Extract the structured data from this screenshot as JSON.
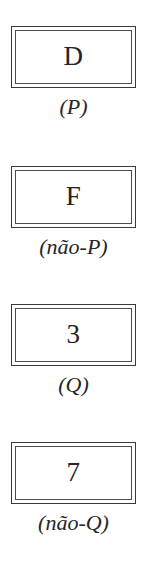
{
  "diagram": {
    "kind": "wason-selection-task-cards",
    "background_color": "#ffffff",
    "ink_color": "#2b2b2b",
    "border_color": "#3a3a3a",
    "cards": [
      {
        "face": "D",
        "label": "(P)"
      },
      {
        "face": "F",
        "label": "(não-P)"
      },
      {
        "face": "3",
        "label": "(Q)"
      },
      {
        "face": "7",
        "label": "(não-Q)"
      }
    ]
  }
}
